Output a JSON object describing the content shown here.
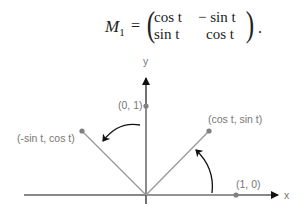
{
  "equation": {
    "lhs": "M",
    "lhs_sub": "1",
    "equals": "=",
    "matrix": [
      [
        "cos t",
        "− sin t"
      ],
      [
        "sin t",
        "cos t"
      ]
    ],
    "trailing": "."
  },
  "diagram": {
    "axis_x_label": "x",
    "axis_y_label": "y",
    "points": [
      {
        "label": "(0, 1)"
      },
      {
        "label": "(1, 0)"
      },
      {
        "label": "(cos t, sin t)"
      },
      {
        "label": "(-sin t, cos t)"
      }
    ],
    "colors": {
      "axis": "#111111",
      "vector": "#999999",
      "point": "#808080",
      "label": "#777777",
      "rotation_arrow": "#111111"
    }
  }
}
